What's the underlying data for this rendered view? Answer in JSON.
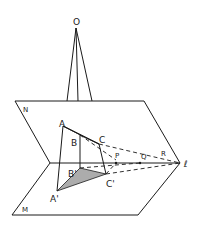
{
  "diagram": {
    "labels": {
      "O": "O",
      "N": "N",
      "M": "M",
      "A": "A",
      "B": "B",
      "C": "C",
      "A_prime": "A'",
      "B_prime": "B'",
      "C_prime": "C'",
      "P": "P",
      "Q": "Q",
      "R": "R",
      "l": "ℓ"
    },
    "colors": {
      "ink": "#1a1a1a",
      "background": "#ffffff"
    }
  }
}
